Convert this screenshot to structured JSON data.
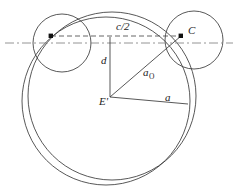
{
  "figure": {
    "type": "geometric-diagram",
    "title": "",
    "background_color": "#ffffff",
    "stroke_color": "#3a3a3a",
    "axis_color": "#777777",
    "label_color": "#222222"
  },
  "labels": {
    "chord_half": "c/2",
    "point_c": "C",
    "distance_d": "d",
    "radius_a_o_base": "a",
    "radius_a_o_subscript": "O",
    "center_e_prime": "E'",
    "radius_a": "a"
  },
  "geometry": {
    "big_circle_outer": {
      "cx": 106,
      "cy": 101,
      "r": 84
    },
    "big_circle_inner": {
      "cx": 112,
      "cy": 96,
      "r": 84
    },
    "small_circle_left": {
      "cx": 62,
      "cy": 43,
      "r": 29
    },
    "small_circle_right": {
      "cx": 194,
      "cy": 40,
      "r": 29
    },
    "axis_line": {
      "x1": 5,
      "y1": 43,
      "x2": 233,
      "y2": 43
    },
    "chord_line": {
      "x1": 51,
      "y1": 36,
      "x2": 181,
      "y2": 36
    },
    "vertical_d_line": {
      "x1": 110,
      "y1": 37,
      "x2": 110,
      "y2": 97
    },
    "center_point": {
      "x": 110,
      "y": 97
    },
    "point_c": {
      "x": 181,
      "y": 36
    },
    "point_left_dot": {
      "x": 51,
      "y": 36
    },
    "radius_a_endpoint": {
      "x": 188,
      "y": 104
    }
  },
  "label_positions": {
    "chord_half": {
      "x": 116,
      "y": 30
    },
    "point_c": {
      "x": 188,
      "y": 34
    },
    "distance_d": {
      "x": 101,
      "y": 64
    },
    "radius_a_o": {
      "x": 143,
      "y": 76
    },
    "center_e_prime": {
      "x": 99,
      "y": 105
    },
    "radius_a": {
      "x": 165,
      "y": 101
    }
  }
}
